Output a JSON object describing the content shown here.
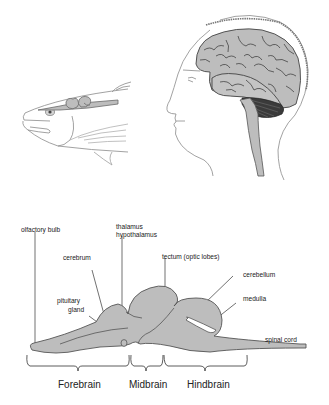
{
  "figure": {
    "top_panel": {
      "fish_illustration": "fish head with brain",
      "human_illustration": "human head with brain"
    },
    "brain_diagram": {
      "labels": {
        "olfactory_bulb": "olfactory bulb",
        "thalamus": "thalamus",
        "hypothalamus": "hypothalamus",
        "cerebrum": "cerebrum",
        "tectum": "tectum (optic lobes)",
        "pituitary_line1": "pituitary",
        "pituitary_line2": "gland",
        "cerebellum": "cerebellum",
        "medulla": "medulla",
        "spinal_cord": "spinal cord"
      },
      "regions": [
        {
          "label": "Forebrain"
        },
        {
          "label": "Midbrain"
        },
        {
          "label": "Hindbrain"
        }
      ]
    },
    "colors": {
      "fill_gray": "#bdbdbd",
      "outline": "#555555",
      "line": "#333333",
      "text": "#222222"
    }
  }
}
